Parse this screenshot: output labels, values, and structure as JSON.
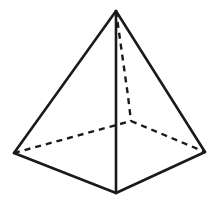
{
  "figure": {
    "name": "square-pyramid-wireframe",
    "kind": "geometric-solid-diagram",
    "caption": "",
    "background_color": "#ffffff",
    "stroke_color": "#1a1a1a",
    "visible_stroke_width": 2.6,
    "hidden_stroke_width": 2.4,
    "hidden_dash_pattern": "6,5",
    "canvas": {
      "width": 219,
      "height": 208
    },
    "vertices": {
      "apex": {
        "label": "apex",
        "x": 116,
        "y": 11
      },
      "front": {
        "label": "front-base-corner",
        "x": 116,
        "y": 193
      },
      "left": {
        "label": "left-base-corner",
        "x": 14,
        "y": 153
      },
      "right": {
        "label": "right-base-corner",
        "x": 205,
        "y": 152
      },
      "back_hidden": {
        "label": "back-base-corner",
        "x": 131,
        "y": 121
      }
    },
    "edges_visible": [
      {
        "name": "apex-to-left-edge",
        "points": "116,11 14,153"
      },
      {
        "name": "apex-to-right-edge",
        "points": "116,11 205,152"
      },
      {
        "name": "apex-to-front-edge",
        "points": "116,11 116,193"
      },
      {
        "name": "left-to-front-edge",
        "points": "14,153 116,193"
      },
      {
        "name": "front-to-right-edge",
        "points": "116,193 205,152"
      }
    ],
    "edges_hidden": [
      {
        "name": "apex-to-back-edge",
        "points": "116,11 128,96 131,121"
      },
      {
        "name": "left-to-back-edge",
        "points": "14,153 131,121"
      },
      {
        "name": "back-to-right-edge",
        "points": "131,121 205,152"
      }
    ]
  }
}
